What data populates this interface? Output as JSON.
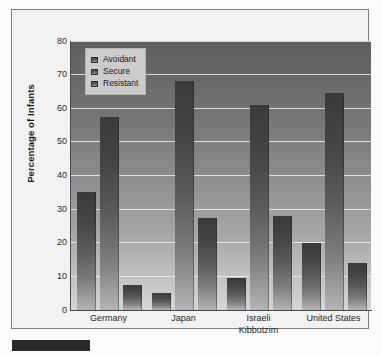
{
  "chart_data": {
    "type": "bar",
    "title": "",
    "xlabel": "",
    "ylabel": "Percentage of Infants",
    "ylim": [
      0,
      80
    ],
    "ytick_step": 10,
    "yticks": [
      80,
      70,
      60,
      50,
      40,
      30,
      20,
      10,
      0
    ],
    "grid": true,
    "legend_position": "top-left-inside",
    "categories": [
      "Germany",
      "Japan",
      "Israeli Kibbutzim",
      "United States"
    ],
    "category_lines": [
      [
        "Germany"
      ],
      [
        "Japan"
      ],
      [
        "Israeli",
        "Kibbutzim"
      ],
      [
        "United States"
      ]
    ],
    "series": [
      {
        "name": "Avoidant",
        "values": [
          35,
          5,
          9.5,
          20
        ]
      },
      {
        "name": "Secure",
        "values": [
          57.5,
          68,
          61,
          64.5
        ]
      },
      {
        "name": "Resistant",
        "values": [
          7.5,
          27.5,
          28,
          14
        ]
      }
    ]
  },
  "legend": {
    "items": [
      {
        "label": "Avoidant"
      },
      {
        "label": "Secure"
      },
      {
        "label": "Resistant"
      }
    ]
  },
  "colors": {
    "bar_dark": "#3a3a3a",
    "bar_light": "#b4b4b4",
    "plot_bg_top": "#5e5e5e",
    "plot_bg_bottom": "#d6d6d6",
    "gridline": "#efefef",
    "axis": "#4a4a4a",
    "frame": "#7e7e7e",
    "legend_bg": "#cccccc",
    "text": "#1f1f1f",
    "caption_bar": "#2a2a2a"
  }
}
